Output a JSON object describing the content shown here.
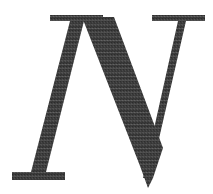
{
  "artwork": {
    "kind": "scanned-initial-letter",
    "letter": "N",
    "letter_case": "uppercase",
    "style": "italic-serif-drop-cap",
    "alt_text": "N",
    "caption": "",
    "width_px": 213,
    "height_px": 194
  },
  "colors": {
    "background": "#ffffff",
    "ink": "#3d3d3d",
    "ink_dark": "#333333",
    "ink_light": "#4a4a4a",
    "texture_dot": "#2e2e2e"
  },
  "geometry": {
    "top_serif_left": {
      "x1": 50,
      "x2": 103,
      "y1": 15,
      "y2": 21
    },
    "top_serif_right": {
      "x1": 152,
      "x2": 205,
      "y1": 15,
      "y2": 21
    },
    "foot_serif_left": {
      "x1": 12,
      "x2": 65,
      "y1": 172,
      "y2": 180
    },
    "diagonal_apex": {
      "x": 148,
      "y": 186
    },
    "left_stem_top_x": 80,
    "left_stem_bottom_x": 40,
    "right_stem_top_x": 182,
    "right_stem_bottom_x": 155,
    "baseline_y": 180,
    "cap_top_y": 15
  },
  "paths": {
    "diagonal": "M 84 17 L 113 17 L 166 150 L 166 186 L 141 186 L 84 44 Z",
    "left_stem": "M 50 15 L 103 15 L 103 21 L 84 21 L 46 172 L 65 172 L 65 180 L 12 180 L 12 172 L 31 172 L 70 21 L 50 21 Z",
    "right_stem": "M 152 15 L 205 15 L 205 21 L 186 21 L 148 186 L 141 186 L 178 21 L 152 21 Z"
  }
}
